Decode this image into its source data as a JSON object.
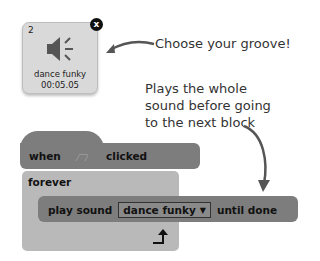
{
  "sound_tile": {
    "number": "2",
    "close_icon": "x",
    "icon": "speaker-icon",
    "name": "dance funky",
    "duration": "00:05.05"
  },
  "callouts": {
    "choose": "Choose your groove!",
    "plays_line1": "Plays the whole",
    "plays_line2": "sound before going",
    "plays_line3": "to the next block"
  },
  "blocks": {
    "hat": {
      "when": "when",
      "flag_icon": "green-flag-icon",
      "clicked": "clicked"
    },
    "forever": {
      "label": "forever",
      "loop_icon": "loop-arrow-icon"
    },
    "play_sound": {
      "label": "play sound",
      "sound": "dance funky",
      "dropdown_icon": "▼",
      "suffix": "until done"
    }
  },
  "colors": {
    "block_dark": "#7d7d7d",
    "block_light": "#b9b9b9",
    "tile_bg": "#d9d9d9",
    "text": "#333333"
  }
}
